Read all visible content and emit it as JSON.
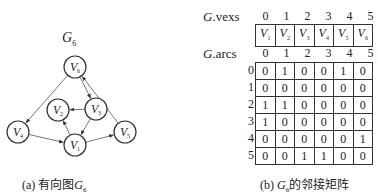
{
  "graph": {
    "title": "G",
    "title_sub": "6",
    "caption_prefix": "(a) 有向图",
    "caption_g": "G",
    "caption_sub": "6",
    "nodes": [
      {
        "id": "V1",
        "label": "V",
        "sub": "1",
        "x": 75,
        "y": 145
      },
      {
        "id": "V2",
        "label": "V",
        "sub": "2",
        "x": 58,
        "y": 110
      },
      {
        "id": "V3",
        "label": "V",
        "sub": "3",
        "x": 96,
        "y": 109
      },
      {
        "id": "V4",
        "label": "V",
        "sub": "4",
        "x": 18,
        "y": 132
      },
      {
        "id": "V5",
        "label": "V",
        "sub": "5",
        "x": 125,
        "y": 132
      },
      {
        "id": "V6",
        "label": "V",
        "sub": "6",
        "x": 75,
        "y": 67
      }
    ],
    "edges": [
      {
        "from": "V6",
        "to": "V4"
      },
      {
        "from": "V6",
        "to": "V3"
      },
      {
        "from": "V3",
        "to": "V2"
      },
      {
        "from": "V3",
        "to": "V1"
      },
      {
        "from": "V1",
        "to": "V2"
      },
      {
        "from": "V4",
        "to": "V1"
      },
      {
        "from": "V1",
        "to": "V5"
      },
      {
        "from": "V5",
        "to": "V6"
      }
    ]
  },
  "vexs": {
    "label_g": "G",
    "label_rest": ".vexs",
    "indices": [
      "0",
      "1",
      "2",
      "3",
      "4",
      "5"
    ],
    "values": [
      {
        "v": "V",
        "sub": "1"
      },
      {
        "v": "V",
        "sub": "2"
      },
      {
        "v": "V",
        "sub": "3"
      },
      {
        "v": "V",
        "sub": "4"
      },
      {
        "v": "V",
        "sub": "5"
      },
      {
        "v": "V",
        "sub": "6"
      }
    ]
  },
  "arcs": {
    "label_g": "G",
    "label_rest": ".arcs",
    "col_indices": [
      "0",
      "1",
      "2",
      "3",
      "4",
      "5"
    ],
    "row_indices": [
      "0",
      "1",
      "2",
      "3",
      "4",
      "5"
    ],
    "matrix": [
      [
        "0",
        "1",
        "0",
        "0",
        "1",
        "0"
      ],
      [
        "0",
        "0",
        "0",
        "0",
        "0",
        "0"
      ],
      [
        "1",
        "1",
        "0",
        "0",
        "0",
        "0"
      ],
      [
        "1",
        "0",
        "0",
        "0",
        "0",
        "0"
      ],
      [
        "0",
        "0",
        "0",
        "0",
        "0",
        "1"
      ],
      [
        "0",
        "0",
        "1",
        "1",
        "0",
        "0"
      ]
    ]
  },
  "caption_b": {
    "prefix": "(b) ",
    "g": "G",
    "sub": "6",
    "suffix": "的邻接矩阵"
  }
}
